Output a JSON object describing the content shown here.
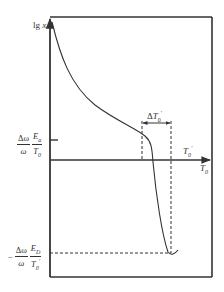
{
  "diagram": {
    "type": "line-diagram",
    "colors": {
      "axis": "#333333",
      "curve": "#333333",
      "dashed": "#333333",
      "background": "#ffffff"
    },
    "y_axis": {
      "label_main": "lg",
      "label_var": "x"
    },
    "x_axis": {
      "label_main": "T",
      "label_sub": "0"
    },
    "x_marker": {
      "label_main": "T",
      "label_sub": "0",
      "label_sup": "'"
    },
    "delta_marker": {
      "label_prefix": "Δ",
      "label_main": "T",
      "label_sub": "0",
      "label_sup": "'"
    },
    "y_tick_upper": {
      "sign": "",
      "num_left": "Δω",
      "den_left": "ω",
      "num_right_main": "E",
      "num_right_sub": "a",
      "den_right_main": "T",
      "den_right_sub": "0",
      "den_right_sup": ""
    },
    "y_tick_lower": {
      "sign": "−",
      "num_left": "Δω",
      "den_left": "ω",
      "num_right_main": "E",
      "num_right_sub": "D",
      "den_right_main": "T",
      "den_right_sub": "0",
      "den_right_sup": "'"
    }
  }
}
